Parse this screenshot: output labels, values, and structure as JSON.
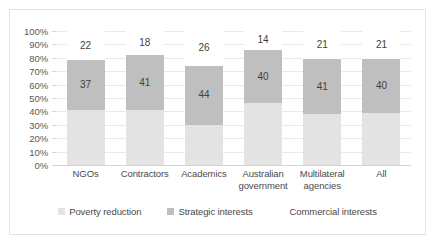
{
  "chart_data": {
    "type": "bar",
    "subtype": "stacked-bar-100",
    "title": "",
    "xlabel": "",
    "ylabel": "",
    "ylim": [
      0,
      100
    ],
    "ytick_labels": [
      "100%",
      "90%",
      "80%",
      "70%",
      "60%",
      "50%",
      "40%",
      "30%",
      "20%",
      "10%",
      "0%"
    ],
    "ytick_values": [
      100,
      90,
      80,
      70,
      60,
      50,
      40,
      30,
      20,
      10,
      0
    ],
    "grid": true,
    "legend_position": "bottom",
    "categories": [
      "NGOs",
      "Contractors",
      "Academics",
      "Australian government",
      "Multilateral agencies",
      "All"
    ],
    "series": [
      {
        "name": "Poverty reduction",
        "color": "#e3e3e3",
        "values": [
          41,
          41,
          30,
          46,
          38,
          39
        ],
        "labels_shown": false
      },
      {
        "name": "Strategic interests",
        "color": "#bfbfbf",
        "values": [
          37,
          41,
          44,
          40,
          41,
          40
        ],
        "labels_shown": true
      },
      {
        "name": "Commercial interests",
        "color": "#ffffff",
        "values": [
          22,
          18,
          26,
          14,
          21,
          21
        ],
        "labels_shown": true
      }
    ]
  },
  "axis": {
    "y_labels": [
      "100%",
      "90%",
      "80%",
      "70%",
      "60%",
      "50%",
      "40%",
      "30%",
      "20%",
      "10%",
      "0%"
    ],
    "x_labels": [
      {
        "line1": "NGOs",
        "line2": ""
      },
      {
        "line1": "Contractors",
        "line2": ""
      },
      {
        "line1": "Academics",
        "line2": ""
      },
      {
        "line1": "Australian",
        "line2": "government"
      },
      {
        "line1": "Multilateral",
        "line2": "agencies"
      },
      {
        "line1": "All",
        "line2": ""
      }
    ]
  },
  "legend": {
    "items": [
      {
        "label": "Poverty reduction",
        "color": "#e3e3e3"
      },
      {
        "label": "Strategic interests",
        "color": "#bfbfbf"
      },
      {
        "label": "Commercial interests",
        "color": "#ffffff"
      }
    ]
  },
  "bars": [
    {
      "category": "NGOs",
      "poverty": 41,
      "strategic": 37,
      "commercial": 22,
      "strategic_label": "37",
      "commercial_label": "22"
    },
    {
      "category": "Contractors",
      "poverty": 41,
      "strategic": 41,
      "commercial": 18,
      "strategic_label": "41",
      "commercial_label": "18"
    },
    {
      "category": "Academics",
      "poverty": 30,
      "strategic": 44,
      "commercial": 26,
      "strategic_label": "44",
      "commercial_label": "26"
    },
    {
      "category": "Australian government",
      "poverty": 46,
      "strategic": 40,
      "commercial": 14,
      "strategic_label": "40",
      "commercial_label": "14"
    },
    {
      "category": "Multilateral agencies",
      "poverty": 38,
      "strategic": 41,
      "commercial": 21,
      "strategic_label": "41",
      "commercial_label": "21"
    },
    {
      "category": "All",
      "poverty": 39,
      "strategic": 40,
      "commercial": 21,
      "strategic_label": "40",
      "commercial_label": "21"
    }
  ]
}
